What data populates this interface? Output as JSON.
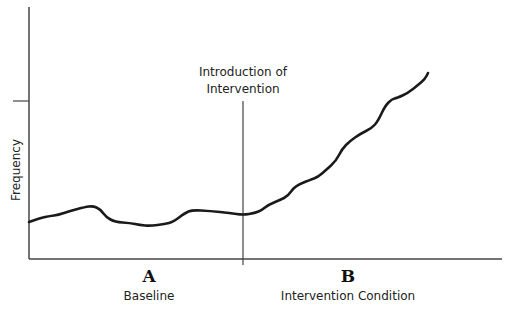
{
  "chart_data": {
    "type": "line",
    "title": "",
    "xlabel": "",
    "ylabel": "Frequency",
    "annotations": [
      {
        "text": "Introduction of Intervention",
        "lines": [
          "Introduction of",
          "Intervention"
        ],
        "x_px": 243
      }
    ],
    "phases": [
      {
        "letter": "A",
        "name": "Baseline"
      },
      {
        "letter": "B",
        "name": "Intervention Condition"
      }
    ],
    "grid": false,
    "legend": null,
    "y_ticks_px": [
      101
    ],
    "axis_px": {
      "x0": 29,
      "y0": 259,
      "x1": 502,
      "ytop": 7
    },
    "phase_divider_x_px": 243,
    "series": [
      {
        "name": "Frequency",
        "color": "#1a1a1a",
        "points_px": [
          [
            29,
            222
          ],
          [
            40,
            218
          ],
          [
            50,
            216
          ],
          [
            58,
            215
          ],
          [
            70,
            211
          ],
          [
            85,
            207
          ],
          [
            93,
            206
          ],
          [
            100,
            209
          ],
          [
            106,
            217
          ],
          [
            115,
            222
          ],
          [
            130,
            223
          ],
          [
            140,
            225
          ],
          [
            150,
            226
          ],
          [
            165,
            224
          ],
          [
            173,
            222
          ],
          [
            185,
            213
          ],
          [
            192,
            210
          ],
          [
            210,
            211
          ],
          [
            230,
            213
          ],
          [
            243,
            215
          ],
          [
            255,
            213
          ],
          [
            262,
            210
          ],
          [
            268,
            205
          ],
          [
            280,
            200
          ],
          [
            288,
            196
          ],
          [
            295,
            186
          ],
          [
            310,
            180
          ],
          [
            318,
            177
          ],
          [
            326,
            170
          ],
          [
            336,
            161
          ],
          [
            342,
            149
          ],
          [
            350,
            141
          ],
          [
            360,
            134
          ],
          [
            372,
            128
          ],
          [
            378,
            121
          ],
          [
            385,
            106
          ],
          [
            392,
            99
          ],
          [
            397,
            98
          ],
          [
            408,
            93
          ],
          [
            418,
            85
          ],
          [
            425,
            79
          ],
          [
            428,
            73
          ]
        ]
      }
    ]
  },
  "labels": {
    "ylabel": "Frequency",
    "annotation_line1": "Introduction of",
    "annotation_line2": "Intervention",
    "phase_a_letter": "A",
    "phase_a_name": "Baseline",
    "phase_b_letter": "B",
    "phase_b_name": "Intervention Condition"
  },
  "colors": {
    "axis": "#444444",
    "line": "#1a1a1a",
    "text": "#222222"
  }
}
